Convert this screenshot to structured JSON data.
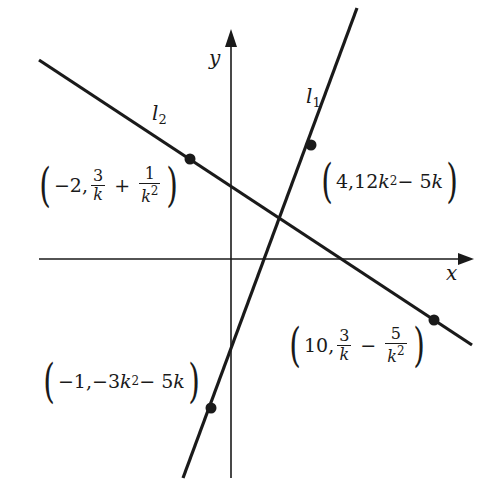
{
  "diagram": {
    "title": "",
    "colors": {
      "ink": "#1a1a1a",
      "background": "#ffffff"
    },
    "axes": {
      "x": {
        "label": "x",
        "from": [
          39,
          259
        ],
        "to": [
          473,
          259
        ]
      },
      "y": {
        "label": "y",
        "from": [
          231,
          478
        ],
        "to": [
          231,
          30
        ]
      }
    },
    "lines": [
      {
        "id": "l1",
        "name": "l",
        "subscript": "1",
        "from": [
          183,
          478
        ],
        "to": [
          357,
          8
        ]
      },
      {
        "id": "l2",
        "name": "l",
        "subscript": "2",
        "from": [
          39,
          60
        ],
        "to": [
          472,
          345
        ]
      }
    ],
    "points": [
      {
        "on": "l2",
        "pos": [
          190,
          159
        ],
        "x": "−2",
        "y": "3/k + 1/k²",
        "x_text": "−2,",
        "frac1_num": "3",
        "frac1_den": "k",
        "op": "+",
        "frac2_num": "1",
        "frac2_den": "k",
        "frac2_exp": "2"
      },
      {
        "on": "l1",
        "pos": [
          311,
          145
        ],
        "x": "4",
        "y": "12k² − 5k",
        "text_a": "4,12",
        "text_k": "k",
        "exp": "2",
        "text_b": " − 5",
        "text_k2": "k"
      },
      {
        "on": "l2",
        "pos": [
          434,
          320
        ],
        "x": "10",
        "y": "3/k − 5/k²",
        "x_text": "10,",
        "frac1_num": "3",
        "frac1_den": "k",
        "op": "−",
        "frac2_num": "5",
        "frac2_den": "k",
        "frac2_exp": "2"
      },
      {
        "on": "l1",
        "pos": [
          211,
          408
        ],
        "x": "−1",
        "y": "−3k² − 5k",
        "text_a": "−1,−3",
        "text_k": "k",
        "exp": "2",
        "text_b": " − 5",
        "text_k2": "k"
      }
    ],
    "parens": {
      "open": "(",
      "close": ")"
    }
  }
}
